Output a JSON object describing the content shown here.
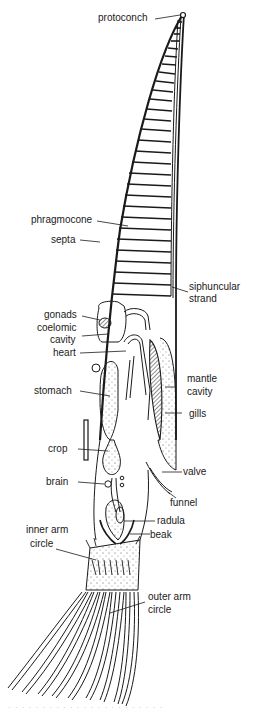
{
  "figure": {
    "labels": {
      "protoconch": "protoconch",
      "phragmocone": "phragmocone",
      "septa": "septa",
      "siphuncular_1": "siphuncular",
      "siphuncular_2": "strand",
      "gonads": "gonads",
      "coelomic_1": "coelomic",
      "coelomic_2": "cavity",
      "heart": "heart",
      "mantle_1": "mantle",
      "mantle_2": "cavity",
      "stomach": "stomach",
      "gills": "gills",
      "crop": "crop",
      "valve": "valve",
      "brain": "brain",
      "funnel": "funnel",
      "radula": "radula",
      "inner_arm_1": "inner arm",
      "inner_arm_2": "circle",
      "beak": "beak",
      "outer_arm_1": "outer arm",
      "outer_arm_2": "circle"
    },
    "caption_cutoff": "· · · ·  · · · · ·  · · · ·  · · · · ·  · · · · ·"
  },
  "colors": {
    "ink": "#1a1a1a",
    "background": "#ffffff"
  }
}
